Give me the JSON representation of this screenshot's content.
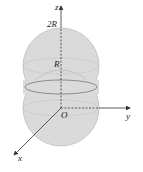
{
  "diagram": {
    "type": "3d-coordinate-solid",
    "axes": {
      "z_label": "z",
      "y_label": "y",
      "x_label": "x",
      "origin_label": "O"
    },
    "ticks": {
      "z_top": "2R",
      "z_mid": "R"
    },
    "colors": {
      "sphere_fill": "#d9d9d9",
      "sphere_edge": "#b5b5b5",
      "axis": "#333333"
    }
  }
}
